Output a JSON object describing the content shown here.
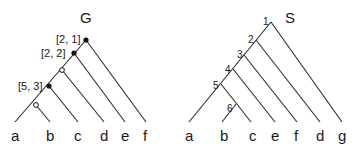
{
  "gene_tree": {
    "title": "G",
    "leaves": [
      "a",
      "b",
      "c",
      "d",
      "e",
      "f"
    ],
    "node_labels": [
      "[2, 1]",
      "[2, 2]",
      "[5, 3]"
    ],
    "node_markers": [
      "filled",
      "filled",
      "open",
      "filled",
      "open"
    ]
  },
  "species_tree": {
    "title": "S",
    "leaves": [
      "a",
      "b",
      "c",
      "e",
      "f",
      "d",
      "g"
    ],
    "node_numbers": [
      "1",
      "2",
      "3",
      "4",
      "5",
      "6"
    ]
  }
}
